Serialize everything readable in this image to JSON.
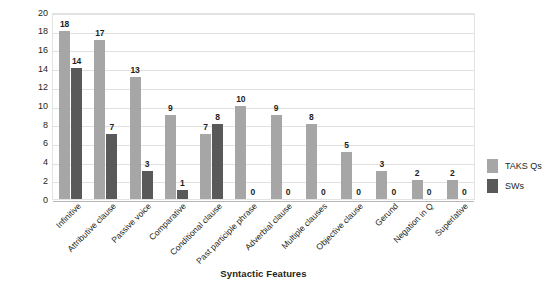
{
  "chart_data": {
    "type": "bar",
    "title": "",
    "xlabel": "Syntactic Features",
    "ylabel": "Occurences",
    "ylim": [
      0,
      20
    ],
    "ytick_step": 2,
    "yticks": [
      20,
      18,
      16,
      14,
      12,
      10,
      8,
      6,
      4,
      2,
      0
    ],
    "grid": true,
    "legend_position": "right",
    "categories": [
      "Infinitive",
      "Attributive clause",
      "Passive voice",
      "Comparative",
      "Conditional clause",
      "Past participle phrase",
      "Adverbial clause",
      "Multiple clauses",
      "Objective clause",
      "Gerund",
      "Negation in Q",
      "Superlative"
    ],
    "series": [
      {
        "name": "TAKS Qs",
        "color": "#a6a6a6",
        "values": [
          18,
          17,
          13,
          9,
          7,
          10,
          9,
          8,
          5,
          3,
          2,
          2
        ]
      },
      {
        "name": "SWs",
        "color": "#595959",
        "values": [
          14,
          7,
          3,
          1,
          8,
          0,
          0,
          0,
          0,
          0,
          0,
          0
        ]
      }
    ]
  },
  "legend": {
    "items": [
      {
        "label": "TAKS Qs",
        "color": "#a6a6a6"
      },
      {
        "label": "SWs",
        "color": "#595959"
      }
    ]
  },
  "axes": {
    "y_title": "Occurences",
    "x_title": "Syntactic Features"
  },
  "colors": {
    "series_taks": "#a6a6a6",
    "series_sws": "#595959",
    "gridline": "#e0e0e0",
    "baseline": "#b6b6b6",
    "plot_border": "#e3e3e3",
    "text": "#231f20",
    "background": "#ffffff"
  }
}
